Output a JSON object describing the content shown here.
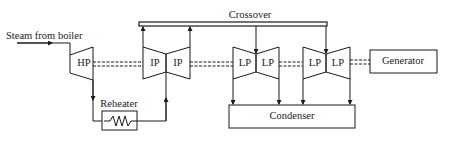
{
  "diagram": {
    "labels": {
      "steam_inlet": "Steam from boiler",
      "crossover": "Crossover",
      "reheater": "Reheater",
      "condenser": "Condenser",
      "generator": "Generator"
    },
    "turbines": [
      {
        "id": "hp",
        "label": "HP"
      },
      {
        "id": "ip1",
        "label": "IP"
      },
      {
        "id": "ip2",
        "label": "IP"
      },
      {
        "id": "lp1",
        "label": "LP"
      },
      {
        "id": "lp2",
        "label": "LP"
      },
      {
        "id": "lp3",
        "label": "LP"
      },
      {
        "id": "lp4",
        "label": "LP"
      }
    ],
    "colors": {
      "line": "#1a1a1a",
      "background": "#ffffff"
    }
  }
}
